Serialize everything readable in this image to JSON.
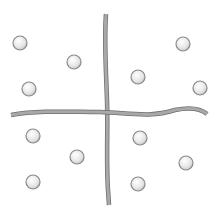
{
  "diagram": {
    "background": "#ffffff",
    "rope_color": "#a8a8a8",
    "rope_edge_color": "#6e6e6e",
    "circle_fill": "#f2f2f2",
    "circle_stroke": "#8a8a8a",
    "circle_radius": 7,
    "ropes": [
      {
        "name": "vertical-rope",
        "path": "M106,14 C104,40 106,70 107,100 C108,130 106,160 108,190 L109,205"
      },
      {
        "name": "horizontal-rope",
        "path": "M11,115 C40,110 70,112 100,112 C130,113 150,118 175,110 C190,107 200,108 207,114"
      }
    ],
    "circles": [
      {
        "quadrant": "top-left",
        "cx": 20,
        "cy": 43
      },
      {
        "quadrant": "top-left",
        "cx": 74,
        "cy": 62
      },
      {
        "quadrant": "top-left",
        "cx": 29,
        "cy": 89
      },
      {
        "quadrant": "top-right",
        "cx": 183,
        "cy": 44
      },
      {
        "quadrant": "top-right",
        "cx": 138,
        "cy": 77
      },
      {
        "quadrant": "top-right",
        "cx": 200,
        "cy": 88
      },
      {
        "quadrant": "bottom-left",
        "cx": 33,
        "cy": 136
      },
      {
        "quadrant": "bottom-left",
        "cx": 77,
        "cy": 157
      },
      {
        "quadrant": "bottom-left",
        "cx": 33,
        "cy": 182
      },
      {
        "quadrant": "bottom-right",
        "cx": 140,
        "cy": 138
      },
      {
        "quadrant": "bottom-right",
        "cx": 186,
        "cy": 163
      },
      {
        "quadrant": "bottom-right",
        "cx": 138,
        "cy": 184
      }
    ]
  }
}
